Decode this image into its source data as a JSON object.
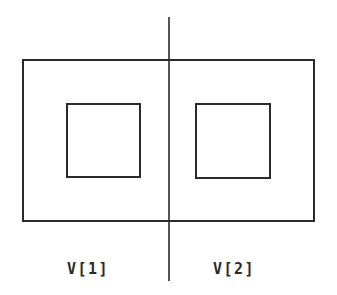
{
  "diagram": {
    "stroke_color": "#2a2a2a",
    "divider": {
      "x": 169,
      "y1": 17,
      "y2": 281
    },
    "outer_rect": {
      "x": 23,
      "y": 60,
      "w": 291,
      "h": 161
    },
    "inner_rects": [
      {
        "x": 67,
        "y": 104,
        "w": 73,
        "h": 73
      },
      {
        "x": 196,
        "y": 104,
        "w": 74,
        "h": 74
      }
    ],
    "labels": [
      {
        "text": "V[1]",
        "x": 67,
        "y": 262
      },
      {
        "text": "V[2]",
        "x": 213,
        "y": 262
      }
    ]
  }
}
